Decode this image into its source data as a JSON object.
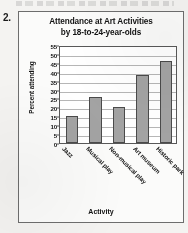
{
  "question": {
    "number": "2."
  },
  "chart_data": {
    "type": "bar",
    "title": "Attendance at Art Activities by 18-to-24-year-olds",
    "title_lines": [
      "Attendance at Art Activities",
      "by 18-to-24-year-olds"
    ],
    "xlabel": "Activity",
    "ylabel": "Percent attending",
    "categories": [
      "Jazz",
      "Musical play",
      "Non-musical play",
      "Art museum",
      "Historic park"
    ],
    "values": [
      15,
      26,
      20,
      38,
      46
    ],
    "ylim": [
      0,
      55
    ],
    "ytick_step": 5,
    "yticks": [
      0,
      5,
      10,
      15,
      20,
      25,
      30,
      35,
      40,
      45,
      50,
      55
    ],
    "ytick_labels": [
      "0",
      "5",
      "10",
      "15",
      "20",
      "25",
      "30",
      "35",
      "40",
      "45",
      "50",
      "55"
    ],
    "grid": true,
    "legend": false,
    "colors": {
      "bar_fill": "#a3a3a3",
      "bar_edge": "#4a4a4a",
      "gridline": "#b6b6b6",
      "axis": "#585858",
      "text": "#131313",
      "plot_background": "#ffffff",
      "figure_background": "#fbfbfa",
      "page_background": "#f4f3f1"
    }
  }
}
